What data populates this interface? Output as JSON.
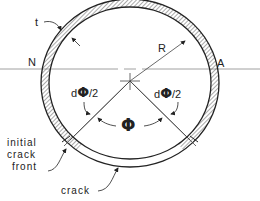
{
  "figure": {
    "type": "pipe cross-section with circumferential crack",
    "labels": {
      "thickness": "t",
      "radius": "R",
      "neutral_axis_left": "N",
      "neutral_axis_right": "A",
      "dphi_left_prefix": "d",
      "dphi_left_symbol": "Φ",
      "dphi_left_suffix": "/2",
      "dphi_right_prefix": "d",
      "dphi_right_symbol": "Φ",
      "dphi_right_suffix": "/2",
      "crack_angle": "Φ",
      "initial_crack_front_line1": "initial",
      "initial_crack_front_line2": "crack",
      "initial_crack_front_line3": "front",
      "crack": "crack"
    },
    "colors": {
      "line": "#222222",
      "hatch": "#555555",
      "axis": "#888888",
      "background": "#ffffff"
    }
  }
}
